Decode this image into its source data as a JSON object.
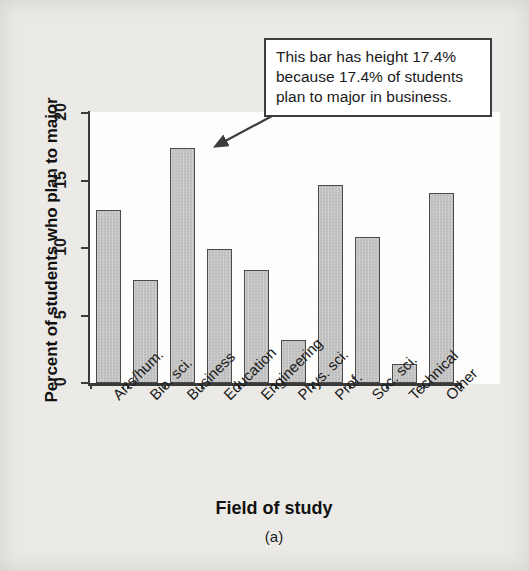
{
  "figure": {
    "caption": "(a)"
  },
  "callout": {
    "text": "This bar has height 17.4% because 17.4% of students plan to major in business.",
    "arrow_name": "callout-arrow-to-business-bar"
  },
  "chart_data": {
    "type": "bar",
    "title": "",
    "xlabel": "Field of study",
    "ylabel": "Percent of students who plan to major",
    "categories": [
      "Arts/hum.",
      "Bio. sci.",
      "Business",
      "Education",
      "Engineering",
      "Phys. sci.",
      "Prof.",
      "Soc. sci.",
      "Technical",
      "Other"
    ],
    "values": [
      12.8,
      7.6,
      17.4,
      9.9,
      8.4,
      3.2,
      14.7,
      10.8,
      1.4,
      14.1
    ],
    "ylim": [
      0,
      20
    ],
    "yticks": [
      0,
      5,
      10,
      15,
      20
    ],
    "ytick_labels": [
      "0",
      "5",
      "10",
      "15",
      "20"
    ],
    "grid": false,
    "legend": false,
    "bar_fill_color": "#c2c2c2",
    "bar_edge_color": "#4a4a4a",
    "plot_background": "#fdfdfc",
    "page_background": "#eceae6",
    "annotation": "This bar has height 17.4% because 17.4% of students plan to major in business."
  }
}
